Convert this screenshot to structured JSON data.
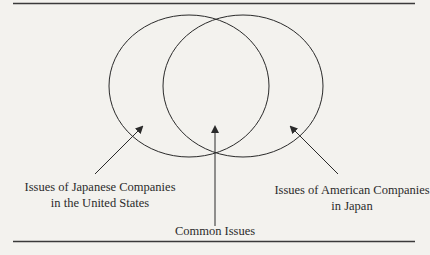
{
  "figure": {
    "type": "venn-diagram",
    "circles": [
      {
        "id": "japanese-in-us",
        "label": "Issues of Japanese Companies in the United States"
      },
      {
        "id": "american-in-japan",
        "label": "Issues of American Companies in Japan"
      }
    ],
    "labels": {
      "left": {
        "line1": "Issues of Japanese Companies",
        "line2": "in the United States"
      },
      "right": {
        "line1": "Issues of American Companies",
        "line2": "in Japan"
      },
      "center": "Common Issues"
    },
    "colors": {
      "background": "#f3f2ee",
      "stroke": "#2a2a2a"
    }
  }
}
